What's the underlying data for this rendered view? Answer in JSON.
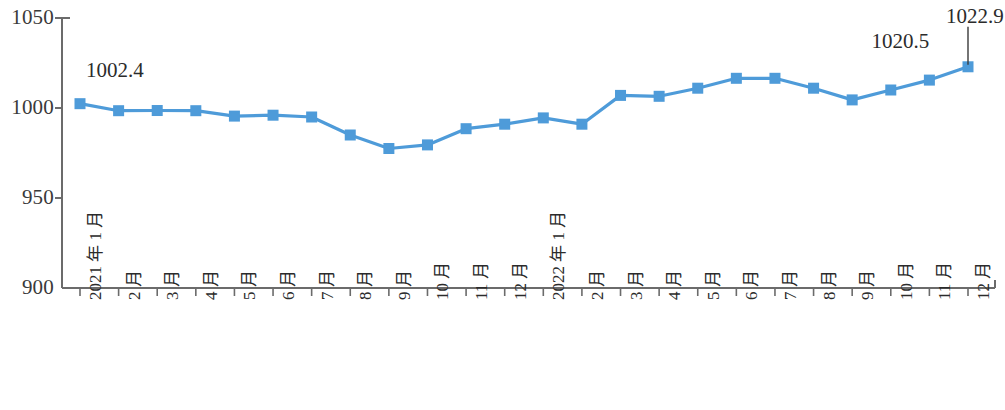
{
  "chart_data": {
    "type": "line",
    "title": "",
    "subtitle": "",
    "xlabel": "",
    "ylabel": "",
    "ylim": [
      900,
      1050
    ],
    "y_ticks": [
      "900",
      "950",
      "1000",
      "1050"
    ],
    "y_tick_values": [
      900,
      950,
      1000,
      1050
    ],
    "grid": false,
    "legend": "none",
    "series_color": "#4E9BD9",
    "marker": "square",
    "categories": [
      "2021 年 1 月",
      "2 月",
      "3 月",
      "4 月",
      "5 月",
      "6 月",
      "7 月",
      "8 月",
      "9 月",
      "10 月",
      "11 月",
      "12 月",
      "2022 年 1 月",
      "2 月",
      "3 月",
      "4 月",
      "5 月",
      "6 月",
      "7 月",
      "8 月",
      "9 月",
      "10 月",
      "11 月",
      "12 月"
    ],
    "values": [
      1002.4,
      998.5,
      998.6,
      998.5,
      995.5,
      996.0,
      995.0,
      985.0,
      977.5,
      979.5,
      988.5,
      991.0,
      994.5,
      991.0,
      1007.0,
      1006.5,
      1011.0,
      1016.5,
      1016.5,
      1011.0,
      1004.5,
      1010.0,
      1015.5,
      1022.9
    ],
    "annotations": [
      {
        "label": "1002.4",
        "index": 0,
        "value": 1002.4,
        "leader": false
      },
      {
        "label": "1020.5",
        "index": 22,
        "value": 1015.5,
        "leader": false
      },
      {
        "label": "1022.9",
        "index": 23,
        "value": 1022.9,
        "leader": true
      }
    ]
  }
}
